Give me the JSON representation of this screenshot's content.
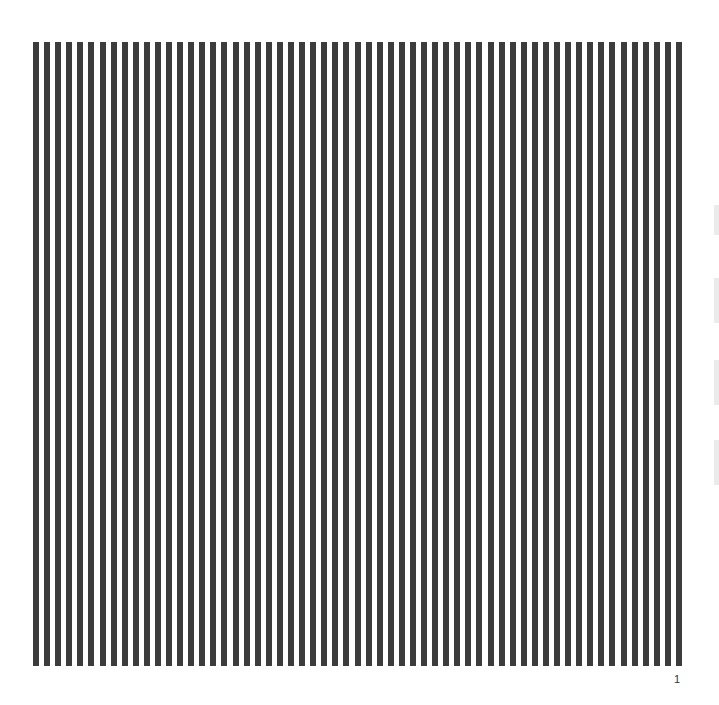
{
  "figure": {
    "type": "vertical-line-grating",
    "stripe_count": 59,
    "stripe_color": "#3c3c3c",
    "background_color": "#ffffff"
  },
  "page": {
    "number": "1"
  }
}
